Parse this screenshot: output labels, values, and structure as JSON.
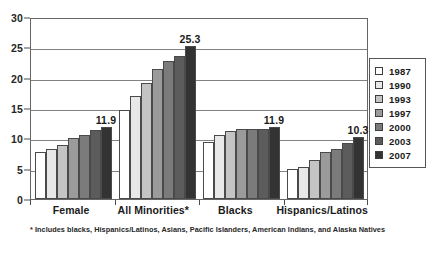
{
  "chart_data": {
    "type": "bar",
    "title": "",
    "subtitle": "",
    "xlabel": "",
    "ylabel": "",
    "ylim": [
      0,
      30
    ],
    "ytick_labels": [
      "0",
      "5",
      "10",
      "15",
      "20",
      "25",
      "30"
    ],
    "ytick_values": [
      0,
      5,
      10,
      15,
      20,
      25,
      30
    ],
    "grid": true,
    "legend_position": "right",
    "categories": [
      "Female",
      "All Minorities*",
      "Blacks",
      "Hispanics/Latinos"
    ],
    "series": [
      {
        "name": "1987",
        "color": "#ffffff",
        "values": [
          7.7,
          14.6,
          9.4,
          4.9
        ]
      },
      {
        "name": "1990",
        "color": "#e8e8e8",
        "values": [
          8.2,
          17.0,
          10.5,
          5.3
        ]
      },
      {
        "name": "1993",
        "color": "#c4c4c4",
        "values": [
          8.9,
          19.1,
          11.2,
          6.5
        ]
      },
      {
        "name": "1997",
        "color": "#9b9b9b",
        "values": [
          10.1,
          21.5,
          11.6,
          7.7
        ]
      },
      {
        "name": "2000",
        "color": "#7b7b7b",
        "values": [
          10.6,
          22.7,
          11.6,
          8.3
        ]
      },
      {
        "name": "2003",
        "color": "#5c5c5c",
        "values": [
          11.3,
          23.6,
          11.6,
          9.2
        ]
      },
      {
        "name": "2007",
        "color": "#333333",
        "values": [
          11.9,
          25.3,
          11.9,
          10.3
        ]
      }
    ],
    "annotations": [
      {
        "category": "Female",
        "series": "2007",
        "text": "11.9"
      },
      {
        "category": "All Minorities*",
        "series": "2007",
        "text": "25.3"
      },
      {
        "category": "Blacks",
        "series": "2007",
        "text": "11.9"
      },
      {
        "category": "Hispanics/Latinos",
        "series": "2007",
        "text": "10.3"
      }
    ],
    "footnote": "* Includes blacks, Hispanics/Latinos, Asians, Pacific Islanders, American Indians, and Alaska Natives"
  }
}
